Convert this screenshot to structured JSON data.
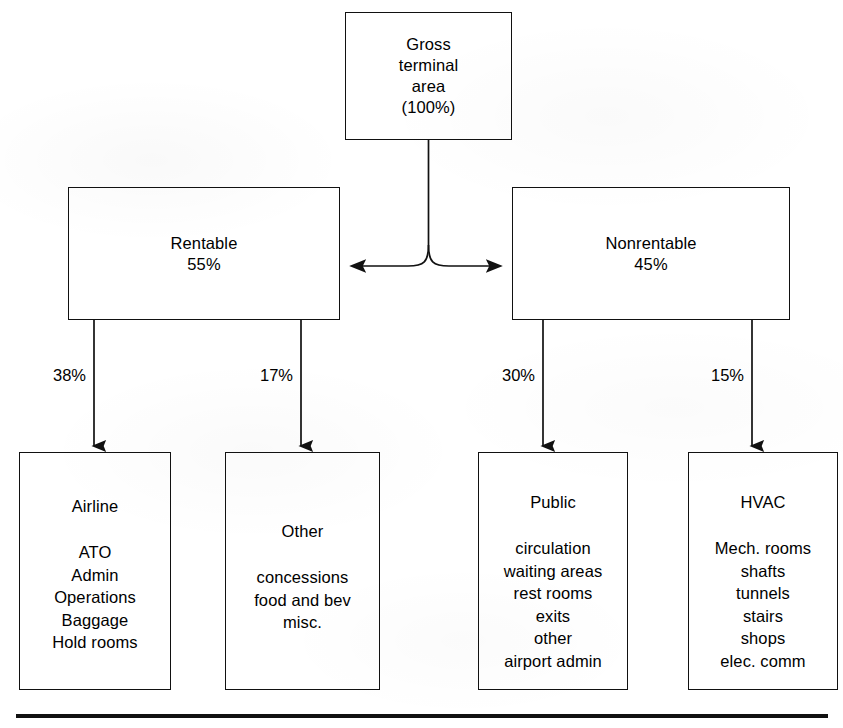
{
  "diagram": {
    "ink_color": "#111111",
    "paper_color": "#ffffff",
    "root": {
      "id": "gross-terminal-area",
      "title": "Gross\nterminal\narea\n(100%)",
      "percent": "100%"
    },
    "level2": [
      {
        "id": "rentable",
        "title": "Rentable\n55%",
        "percent": "55%",
        "label": "Rentable"
      },
      {
        "id": "nonrentable",
        "title": "Nonrentable\n45%",
        "percent": "45%",
        "label": "Nonrentable"
      }
    ],
    "edges": [
      {
        "id": "edge-airline",
        "label": "38%",
        "from": "rentable",
        "to": "airline"
      },
      {
        "id": "edge-other",
        "label": "17%",
        "from": "rentable",
        "to": "other"
      },
      {
        "id": "edge-public",
        "label": "30%",
        "from": "nonrentable",
        "to": "public"
      },
      {
        "id": "edge-hvac",
        "label": "15%",
        "from": "nonrentable",
        "to": "hvac"
      }
    ],
    "leaves": [
      {
        "id": "airline",
        "title": "Airline",
        "items": [
          "ATO",
          "Admin",
          "Operations",
          "Baggage",
          "Hold rooms"
        ]
      },
      {
        "id": "other",
        "title": "Other",
        "items": [
          "concessions",
          "food and bev",
          "misc."
        ]
      },
      {
        "id": "public",
        "title": "Public",
        "items": [
          "circulation",
          "waiting areas",
          "rest rooms",
          "exits",
          "other",
          "airport admin"
        ]
      },
      {
        "id": "hvac",
        "title": "HVAC",
        "items": [
          "Mech. rooms",
          "shafts",
          "tunnels",
          "stairs",
          "shops",
          "elec. comm"
        ]
      }
    ]
  }
}
